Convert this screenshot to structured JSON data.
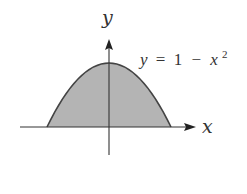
{
  "figure": {
    "y_axis_label": "y",
    "x_axis_label": "x",
    "equation": {
      "lhs": "y",
      "op": "=",
      "rhs_const": "1",
      "minus": "−",
      "var": "x",
      "exponent": "2"
    }
  },
  "colors": {
    "fill": "#b4b4b4",
    "curve": "#444444",
    "axes": "#333333"
  },
  "curve": {
    "function": "y = 1 - x^2",
    "x_range": [
      -1,
      1
    ],
    "region": "area under curve above x-axis shaded"
  }
}
